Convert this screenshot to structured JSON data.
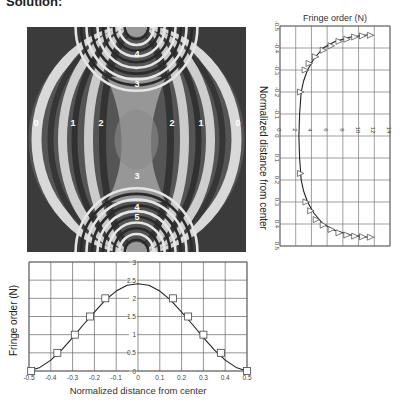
{
  "heading": "Solution:",
  "fringe_pattern": {
    "labels": [
      {
        "text": "0",
        "x": 36,
        "y": 122
      },
      {
        "text": "1",
        "x": 73,
        "y": 122
      },
      {
        "text": "2",
        "x": 101,
        "y": 122
      },
      {
        "text": "2",
        "x": 172,
        "y": 122
      },
      {
        "text": "1",
        "x": 201,
        "y": 122
      },
      {
        "text": "0",
        "x": 238,
        "y": 122
      },
      {
        "text": "4",
        "x": 137,
        "y": 53
      },
      {
        "text": "3",
        "x": 137,
        "y": 83
      },
      {
        "text": "3",
        "x": 137,
        "y": 175
      },
      {
        "text": "4",
        "x": 137,
        "y": 206
      },
      {
        "text": "5",
        "x": 137,
        "y": 216
      }
    ]
  },
  "chart_data": [
    {
      "type": "line",
      "title": "Fringe order (N)",
      "xlabel": "Fringe order (N)",
      "ylabel": "Normalized distance from center",
      "orientation": "rotated",
      "x_ticks": [
        "0",
        "2",
        "4",
        "6",
        "8",
        "10",
        "12",
        "14"
      ],
      "y_ticks": [
        "-0.5",
        "-0.4",
        "-0.3",
        "-0.2",
        "-0.1",
        "0",
        "0.1",
        "0.2",
        "0.3",
        "0.4",
        "0.5"
      ],
      "xlim": [
        0,
        14
      ],
      "ylim": [
        -0.5,
        0.5
      ],
      "series": [
        {
          "name": "Experimental (triangles)",
          "marker": "triangle",
          "points": [
            [
              11.5,
              -0.458
            ],
            [
              10.5,
              -0.455
            ],
            [
              9.5,
              -0.45
            ],
            [
              8.5,
              -0.44
            ],
            [
              7.5,
              -0.43
            ],
            [
              6.5,
              -0.41
            ],
            [
              5.5,
              -0.39
            ],
            [
              4.5,
              -0.36
            ],
            [
              3.7,
              -0.33
            ],
            [
              3.2,
              -0.3
            ],
            [
              2.6,
              -0.2
            ],
            [
              2.6,
              0.17
            ],
            [
              3.3,
              0.3
            ],
            [
              3.9,
              0.34
            ],
            [
              4.6,
              0.38
            ],
            [
              5.5,
              0.405
            ],
            [
              6.5,
              0.425
            ],
            [
              7.5,
              0.44
            ],
            [
              8.5,
              0.45
            ],
            [
              9.5,
              0.455
            ],
            [
              10.5,
              0.458
            ],
            [
              11.5,
              0.46
            ]
          ]
        },
        {
          "name": "Theory (curve)",
          "marker": "none",
          "points": [
            [
              11.2,
              -0.46
            ],
            [
              9,
              -0.45
            ],
            [
              7,
              -0.43
            ],
            [
              5.5,
              -0.4
            ],
            [
              4.3,
              -0.35
            ],
            [
              3.5,
              -0.3
            ],
            [
              3.0,
              -0.25
            ],
            [
              2.7,
              -0.2
            ],
            [
              2.5,
              -0.1
            ],
            [
              2.4,
              0
            ],
            [
              2.5,
              0.1
            ],
            [
              2.7,
              0.2
            ],
            [
              3.0,
              0.25
            ],
            [
              3.5,
              0.3
            ],
            [
              4.3,
              0.35
            ],
            [
              5.5,
              0.4
            ],
            [
              7,
              0.43
            ],
            [
              9,
              0.45
            ],
            [
              11.2,
              0.46
            ]
          ]
        }
      ]
    },
    {
      "type": "line",
      "title": "",
      "xlabel": "Normalized distance from center",
      "ylabel": "Fringe order (N)",
      "x_ticks": [
        "-0.5",
        "-0.4",
        "-0.3",
        "-0.2",
        "-0.1",
        "0",
        "0.1",
        "0.2",
        "0.3",
        "0.4",
        "0.5"
      ],
      "y_ticks": [
        "0",
        "0.5",
        "1",
        "1.5",
        "2",
        "2.5",
        "3"
      ],
      "xlim": [
        -0.5,
        0.5
      ],
      "ylim": [
        0,
        3
      ],
      "grid": true,
      "series": [
        {
          "name": "Experimental (squares)",
          "marker": "square",
          "points": [
            [
              -0.49,
              0
            ],
            [
              -0.37,
              0.5
            ],
            [
              -0.29,
              1.0
            ],
            [
              -0.22,
              1.5
            ],
            [
              -0.15,
              2.0
            ],
            [
              0.16,
              2.0
            ],
            [
              0.23,
              1.5
            ],
            [
              0.3,
              1.0
            ],
            [
              0.38,
              0.5
            ],
            [
              0.5,
              0
            ]
          ]
        },
        {
          "name": "Theory (curve)",
          "marker": "none",
          "points": [
            [
              -0.5,
              0
            ],
            [
              -0.45,
              0.1
            ],
            [
              -0.4,
              0.3
            ],
            [
              -0.35,
              0.58
            ],
            [
              -0.3,
              0.92
            ],
            [
              -0.25,
              1.28
            ],
            [
              -0.2,
              1.62
            ],
            [
              -0.15,
              1.95
            ],
            [
              -0.1,
              2.2
            ],
            [
              -0.05,
              2.36
            ],
            [
              0,
              2.4
            ],
            [
              0.05,
              2.36
            ],
            [
              0.1,
              2.2
            ],
            [
              0.15,
              1.95
            ],
            [
              0.2,
              1.62
            ],
            [
              0.25,
              1.28
            ],
            [
              0.3,
              0.92
            ],
            [
              0.35,
              0.58
            ],
            [
              0.4,
              0.3
            ],
            [
              0.45,
              0.1
            ],
            [
              0.5,
              0
            ]
          ]
        }
      ]
    }
  ]
}
